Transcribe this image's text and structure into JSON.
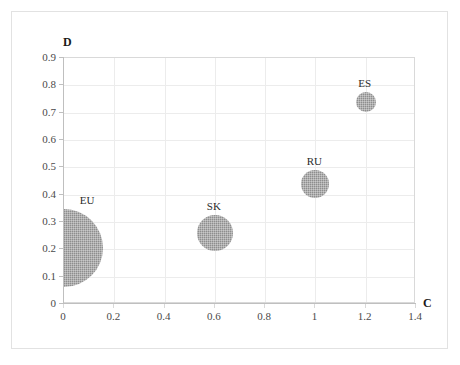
{
  "chart_data": {
    "type": "scatter",
    "subtype": "bubble",
    "title": "",
    "xlabel": "C",
    "ylabel": "D",
    "xlim": [
      0,
      1.4
    ],
    "ylim": [
      0,
      0.9
    ],
    "grid": true,
    "legend": "none",
    "x_ticks": [
      "0",
      "0.2",
      "0.4",
      "0.6",
      "0.8",
      "1",
      "1.2",
      "1.4"
    ],
    "x_tick_values": [
      0,
      0.2,
      0.4,
      0.6,
      0.8,
      1.0,
      1.2,
      1.4
    ],
    "y_ticks": [
      "0.9",
      "0.8",
      "0.7",
      "0.6",
      "0.5",
      "0.4",
      "0.3",
      "0.2",
      "0.1",
      "0"
    ],
    "y_tick_values": [
      0.9,
      0.8,
      0.7,
      0.6,
      0.5,
      0.4,
      0.3,
      0.2,
      0.1,
      0
    ],
    "bubble_color": "#8e8e8e",
    "grid_color": "#ececec",
    "axis_color": "#bfbfbf",
    "points": [
      {
        "label": "EU",
        "x": 0.0,
        "y": 0.205,
        "radius_px": 39,
        "size_rank": 1,
        "clipped_at_axis": true
      },
      {
        "label": "SK",
        "x": 0.6,
        "y": 0.26,
        "radius_px": 18,
        "size_rank": 2,
        "clipped_at_axis": false
      },
      {
        "label": "RU",
        "x": 1.0,
        "y": 0.44,
        "radius_px": 14,
        "size_rank": 3,
        "clipped_at_axis": false
      },
      {
        "label": "ES",
        "x": 1.2,
        "y": 0.74,
        "radius_px": 10,
        "size_rank": 4,
        "clipped_at_axis": false
      }
    ]
  },
  "axis_titles": {
    "y": "D",
    "x": "C"
  }
}
